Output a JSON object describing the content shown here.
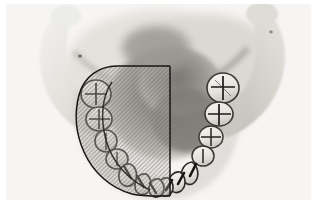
{
  "figure": {
    "kind": "anatomical-photograph",
    "caption": "",
    "width": 317,
    "height": 224,
    "background_color": "#fdfdfd"
  },
  "palette": {
    "background": "#fdfdfd",
    "bone_light": "#e8e6e2",
    "bone_mid": "#d2cfc9",
    "bone_shadow": "#b4b0a9",
    "cavity_dark": "#8d8a85",
    "cavity_darkest": "#6f6c68",
    "tooth_enamel": "#efeee9",
    "tooth_edge": "#2b2a28",
    "fissure_line": "#1c1b1a",
    "overlay_outline": "#171615",
    "overlay_hatch": "#6a6864"
  },
  "overlay": {
    "label": "hatched-region",
    "description": "diagonal hatch overlay covering the left hemi-arch",
    "hatch_angle_deg": 45,
    "hatch_spacing_px": 2,
    "outline_color": "#171615",
    "midline_edge_x": 170,
    "top_y": 66,
    "bottom_y": 196
  },
  "anatomy": {
    "left_ramus": {
      "label": "left ramus",
      "shown": true
    },
    "right_ramus": {
      "label": "right ramus",
      "shown": true
    },
    "left_condyle": {
      "label": "left condyle",
      "shown": true
    },
    "right_condyle": {
      "label": "right condyle",
      "shown": true
    },
    "oral_cavity_shadow": {
      "label": "oral cavity shadow",
      "shown": true
    },
    "dental_arch": {
      "label": "mandibular dental arch",
      "shown": true
    }
  },
  "teeth": {
    "left_side": [
      {
        "name": "left-second-molar",
        "cx": 96,
        "cy": 93,
        "rx": 15,
        "ry": 14,
        "fissure": "cross"
      },
      {
        "name": "left-first-molar",
        "cx": 99,
        "cy": 118,
        "rx": 13,
        "ry": 12,
        "fissure": "cross"
      },
      {
        "name": "left-second-premolar",
        "cx": 106,
        "cy": 140,
        "rx": 11,
        "ry": 10,
        "fissure": "line"
      },
      {
        "name": "left-first-premolar",
        "cx": 117,
        "cy": 158,
        "rx": 10,
        "ry": 10,
        "fissure": "line"
      },
      {
        "name": "left-canine",
        "cx": 131,
        "cy": 173,
        "rx": 10,
        "ry": 10,
        "fissure": "point"
      },
      {
        "name": "left-lateral-incisor",
        "cx": 146,
        "cy": 183,
        "rx": 9,
        "ry": 9,
        "fissure": "none"
      },
      {
        "name": "left-central-incisor",
        "cx": 160,
        "cy": 188,
        "rx": 9,
        "ry": 9,
        "fissure": "none"
      }
    ],
    "right_side": [
      {
        "name": "right-second-molar",
        "cx": 223,
        "cy": 88,
        "rx": 16,
        "ry": 15,
        "fissure": "cross"
      },
      {
        "name": "right-first-molar",
        "cx": 219,
        "cy": 114,
        "rx": 14,
        "ry": 12,
        "fissure": "cross"
      },
      {
        "name": "right-second-premolar",
        "cx": 212,
        "cy": 137,
        "rx": 12,
        "ry": 11,
        "fissure": "cross"
      },
      {
        "name": "right-first-premolar",
        "cx": 204,
        "cy": 156,
        "rx": 11,
        "ry": 10,
        "fissure": "line"
      },
      {
        "name": "right-canine",
        "cx": 192,
        "cy": 172,
        "rx": 10,
        "ry": 10,
        "fissure": "point"
      },
      {
        "name": "right-lateral-incisor",
        "cx": 179,
        "cy": 182,
        "rx": 9,
        "ry": 9,
        "fissure": "none"
      },
      {
        "name": "right-central-incisor",
        "cx": 167,
        "cy": 189,
        "rx": 9,
        "ry": 9,
        "fissure": "none"
      }
    ]
  }
}
